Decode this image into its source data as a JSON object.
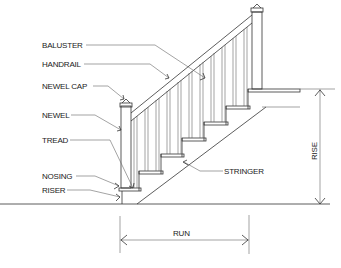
{
  "diagram": {
    "labels": {
      "baluster": "BALUSTER",
      "handrail": "HANDRAIL",
      "newel_cap": "NEWEL CAP",
      "newel": "NEWEL",
      "tread": "TREAD",
      "nosing": "NOSING",
      "riser": "RISER",
      "stringer": "STRINGER"
    },
    "dimensions": {
      "rise": "RISE",
      "run": "RUN"
    },
    "colors": {
      "line": "#333333",
      "background": "#ffffff"
    }
  }
}
